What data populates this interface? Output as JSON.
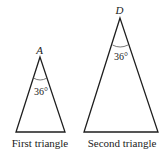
{
  "figure": {
    "triangles": [
      {
        "name": "First triangle",
        "caption": "First triangle",
        "apex_label": "A",
        "apex_angle": "36°"
      },
      {
        "name": "Second triangle",
        "caption": "Second triangle",
        "apex_label": "D",
        "apex_angle": "36°"
      }
    ],
    "colors": {
      "line": "#1e1e1e",
      "text": "#222222",
      "background": "#ffffff"
    }
  }
}
